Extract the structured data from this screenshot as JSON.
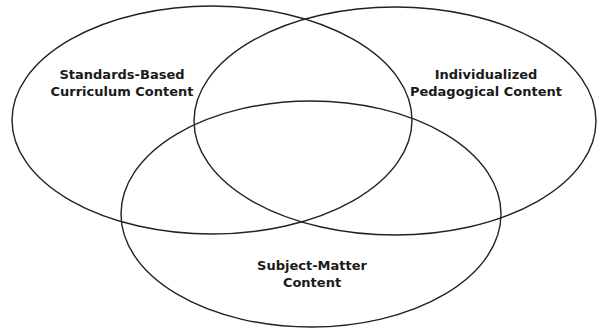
{
  "diagram": {
    "type": "venn",
    "stroke_color": "#222222",
    "background": "#ffffff",
    "sets": [
      {
        "id": "standards",
        "label_lines": [
          "Standards-Based",
          "Curriculum Content"
        ],
        "ellipse": {
          "cx": 212,
          "cy": 120,
          "rx": 200,
          "ry": 114
        },
        "label_pos": {
          "x": 122,
          "y": 66
        }
      },
      {
        "id": "pedagogical",
        "label_lines": [
          "Individualized",
          "Pedagogical Content"
        ],
        "ellipse": {
          "cx": 395,
          "cy": 121,
          "rx": 201,
          "ry": 114
        },
        "label_pos": {
          "x": 486,
          "y": 66
        }
      },
      {
        "id": "subject",
        "label_lines": [
          "Subject-Matter",
          "Content"
        ],
        "ellipse": {
          "cx": 311,
          "cy": 214,
          "rx": 190,
          "ry": 113
        },
        "label_pos": {
          "x": 312,
          "y": 257
        }
      }
    ]
  }
}
